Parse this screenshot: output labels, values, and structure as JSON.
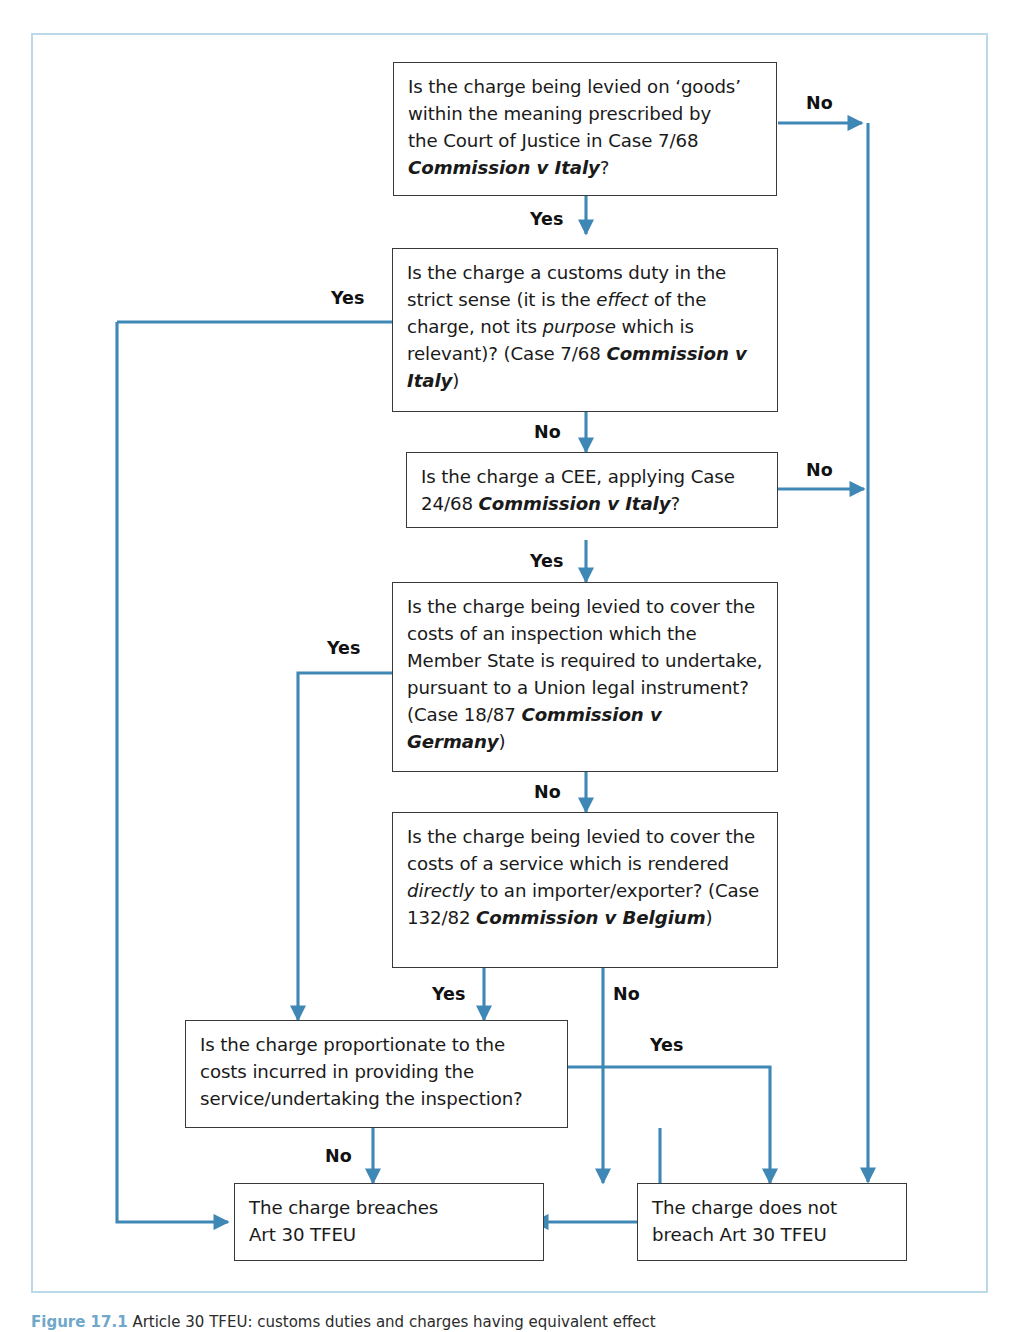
{
  "figure": {
    "caption_number": "Figure 17.1",
    "caption_text": "Article 30 TFEU: customs duties and charges having equivalent effect",
    "frame_color": "#bcd9ea",
    "connector_color": "#3f87b5",
    "box_border_color": "#3a3a3a",
    "box_shadow_color": "#a8a8a8"
  },
  "nodes": {
    "goods": {
      "id": "q-goods",
      "lines": [
        "Is the charge being levied on ‘goods’",
        "within the meaning prescribed by",
        "the Court of Justice in Case 7/68"
      ],
      "case_italic": "Commission v Italy",
      "tail": "?"
    },
    "customs_duty": {
      "id": "q-customs-duty",
      "seg1": "Is the charge a customs duty in the strict sense (it is the ",
      "em1": "effect",
      "seg2": " of the charge, not its ",
      "em2": "purpose",
      "seg3": " which is relevant)? (Case 7/68 ",
      "case_italic": "Commission v Italy",
      "tail": ")"
    },
    "cee": {
      "id": "q-cee",
      "seg1": "Is the charge a CEE, applying Case 24/68 ",
      "case_italic": "Commission v Italy",
      "tail": "?"
    },
    "inspection": {
      "id": "q-inspection",
      "seg1": "Is the charge being levied to cover the costs of an inspection which the Member State is required to undertake, pursuant to a Union legal instrument? (Case 18/87 ",
      "case_italic": "Commission v Germany",
      "tail": ")"
    },
    "service": {
      "id": "q-service",
      "seg1": "Is the charge being levied to cover the costs of a service which is rendered ",
      "em1": "directly",
      "seg2": " to an importer/exporter? (Case 132/82 ",
      "case_italic": "Commission v Belgium",
      "tail": ")"
    },
    "proportionate": {
      "id": "q-proportionate",
      "text": "Is the charge proportionate to the costs incurred in providing the service/undertaking the inspection?"
    },
    "breaches": {
      "id": "outcome-breaches",
      "line1": "The charge breaches",
      "line2": "Art 30 TFEU"
    },
    "not_breaches": {
      "id": "outcome-not-breaches",
      "line1": "The charge does not",
      "line2": "breach Art 30 TFEU"
    }
  },
  "edge_labels": {
    "goods_no": "No",
    "goods_yes": "Yes",
    "customs_yes": "Yes",
    "customs_no": "No",
    "cee_no": "No",
    "cee_yes": "Yes",
    "inspection_yes": "Yes",
    "inspection_no": "No",
    "service_yes": "Yes",
    "service_no": "No",
    "proportionate_yes": "Yes",
    "proportionate_no": "No"
  }
}
